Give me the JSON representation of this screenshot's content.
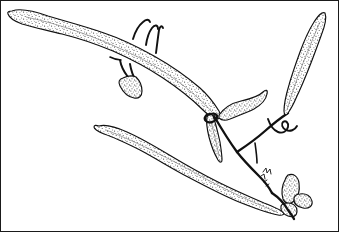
{
  "figure": {
    "medium": "pen-and-ink stipple illustration",
    "background_color": "#ffffff",
    "ink_color": "#111111",
    "stipple_color": "#3a3a3a",
    "frame_color": "#1a1a1a",
    "canvas": {
      "width": 339,
      "height": 232
    },
    "caption": ""
  },
  "parts": [
    {
      "id": "upper-left-blade",
      "name": "upper-left-blade",
      "label": "Upper left elongate blade",
      "description": "Long tapering stippled strap-shaped blade running from upper-left tip down to the central junction",
      "tip": {
        "x": 12,
        "y": 11
      },
      "base": {
        "x": 218,
        "y": 119
      },
      "fill": "stipple"
    },
    {
      "id": "lower-left-blade",
      "name": "lower-left-blade",
      "label": "Lower left elongate blade",
      "description": "Second long tapering stippled blade running from mid-left down toward lower right",
      "tip": {
        "x": 99,
        "y": 126
      },
      "base": {
        "x": 283,
        "y": 212
      },
      "fill": "stipple"
    },
    {
      "id": "right-lanceolate-blade",
      "name": "right-lanceolate-blade",
      "label": "Right lanceolate blade",
      "description": "Spear-shaped stippled blade in the upper right, widest near the middle, attached by a short stalk",
      "tip": {
        "x": 325,
        "y": 13
      },
      "base": {
        "x": 288,
        "y": 113
      },
      "fill": "stipple"
    },
    {
      "id": "central-small-blade",
      "name": "central-small-blade",
      "label": "Central recurved blade",
      "description": "Short hooked stippled blade curving to the right of the central junction",
      "tip": {
        "x": 265,
        "y": 92
      },
      "base": {
        "x": 222,
        "y": 113
      },
      "fill": "stipple"
    },
    {
      "id": "pendant-blade",
      "name": "pendant-blade",
      "label": "Pendant narrow blade",
      "description": "Narrow downward-hanging stippled blade below the central junction",
      "tip": {
        "x": 222,
        "y": 160
      },
      "base": {
        "x": 214,
        "y": 116
      },
      "fill": "stipple"
    },
    {
      "id": "hook-appendage-a",
      "name": "hook-appendage-a",
      "label": "Upper hook appendage",
      "description": "Slender curved hook rising from the upper margin of the upper-left blade"
    },
    {
      "id": "hook-appendage-b",
      "name": "hook-appendage-b",
      "label": "Second upper hook appendage",
      "description": "Second slender curved hook alongside the first"
    },
    {
      "id": "hook-appendage-c",
      "name": "hook-appendage-c",
      "label": "Third upper hook appendage",
      "description": "Straight tapering spine on the upper margin of the blade"
    },
    {
      "id": "lower-hook-pair",
      "name": "lower-hook-pair",
      "label": "Lower hook pair",
      "description": "Pair of short hooks projecting downward from the lower margin of the upper-left blade"
    },
    {
      "id": "small-leaflet",
      "name": "small-leaflet",
      "label": "Small stippled leaflet",
      "description": "Small pointed stippled leaflet hanging below the upper-left blade"
    },
    {
      "id": "main-stipe",
      "name": "main-stipe",
      "label": "Main stipe",
      "description": "Thick dark branching stalk running from the central junction down to the lower right"
    },
    {
      "id": "stipe-branch-right",
      "name": "stipe-branch-right",
      "label": "Right stipe branch",
      "description": "Branch of the stipe rising to the right toward the lanceolate blade"
    },
    {
      "id": "curled-tendril",
      "name": "curled-tendril",
      "label": "Curled tendril",
      "description": "Small curled hook-shaped tendril on the right stipe branch"
    },
    {
      "id": "bud-cluster",
      "name": "bud-cluster",
      "label": "Bud cluster",
      "description": "Cluster of three small rounded stippled buds at the lower right end of the stipe"
    },
    {
      "id": "serrate-node",
      "name": "serrate-node",
      "label": "Serrate node",
      "description": "Small toothed node on the stipe above the bud cluster"
    }
  ]
}
